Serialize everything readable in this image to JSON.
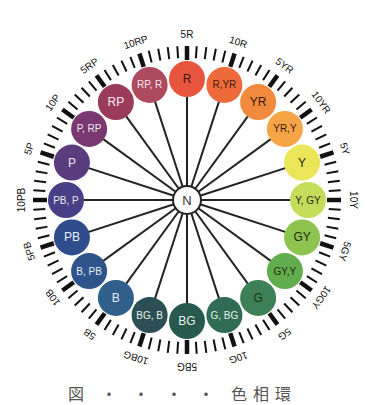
{
  "diagram": {
    "type": "munsell-hue-circle",
    "center": {
      "label": "N",
      "x": 187,
      "y": 200,
      "radius": 14
    },
    "hue_ring_radius": 121,
    "hue_circle_radius": 18,
    "hues": [
      {
        "label": "R",
        "color": "#e8553f",
        "text": "#3a1a10"
      },
      {
        "label": "R,YR",
        "color": "#ef6a3a",
        "text": "#3a1a10"
      },
      {
        "label": "YR",
        "color": "#f28a3e",
        "text": "#3a1a10"
      },
      {
        "label": "YR,Y",
        "color": "#f7a447",
        "text": "#3a1a10"
      },
      {
        "label": "Y",
        "color": "#ebe559",
        "text": "#2a2a10"
      },
      {
        "label": "Y, GY",
        "color": "#c4dc5a",
        "text": "#2a2a10"
      },
      {
        "label": "GY",
        "color": "#8cc44f",
        "text": "#1f2a10"
      },
      {
        "label": "GY,Y",
        "color": "#62ad4e",
        "text": "#1f2a10"
      },
      {
        "label": "G",
        "color": "#3d7f56",
        "text": "#1d3020"
      },
      {
        "label": "G, BG",
        "color": "#2f6b55",
        "text": "#e6efe8"
      },
      {
        "label": "BG",
        "color": "#27594e",
        "text": "#e6efe8"
      },
      {
        "label": "BG, B",
        "color": "#2b4f55",
        "text": "#e6efe8"
      },
      {
        "label": "B",
        "color": "#2f5f8a",
        "text": "#e6eef8"
      },
      {
        "label": "B, PB",
        "color": "#2f548c",
        "text": "#e6eef8"
      },
      {
        "label": "PB",
        "color": "#2f4c8c",
        "text": "#e6eef8"
      },
      {
        "label": "PB, P",
        "color": "#483f86",
        "text": "#ece8f6"
      },
      {
        "label": "P",
        "color": "#5a3b7e",
        "text": "#ece8f6"
      },
      {
        "label": "P, RP",
        "color": "#79386f",
        "text": "#f3e8ef"
      },
      {
        "label": "RP",
        "color": "#9b3b5c",
        "text": "#f6e8ee"
      },
      {
        "label": "RP, R",
        "color": "#ad4a5e",
        "text": "#f6e8ee"
      }
    ],
    "scale_labels": [
      "5R",
      "10R",
      "5YR",
      "10YR",
      "5Y",
      "10Y",
      "5GY",
      "10GY",
      "5G",
      "10G",
      "5BG",
      "10BG",
      "5B",
      "10B",
      "5PB",
      "10PB",
      "5P",
      "10P",
      "5RP",
      "10RP"
    ],
    "tick_ring": {
      "inner": 142,
      "outer": 154,
      "major_inner": 140,
      "count": 100
    },
    "label_radius": 166
  },
  "caption": "図 ・ ・ ・ ・ 色相環"
}
